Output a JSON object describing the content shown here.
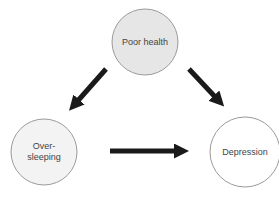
{
  "diagram": {
    "type": "causal-triangle",
    "nodes": [
      {
        "id": "poor_health",
        "label": "Poor health",
        "cx": 145,
        "cy": 42,
        "r": 33,
        "fill": "#e6e6e6"
      },
      {
        "id": "oversleeping",
        "label_lines": [
          "Over-",
          "sleeping"
        ],
        "cx": 44,
        "cy": 152,
        "r": 33,
        "fill": "#f3f3f3"
      },
      {
        "id": "depression",
        "label": "Depression",
        "cx": 245,
        "cy": 152,
        "r": 35,
        "fill": "#ffffff"
      }
    ],
    "edges": [
      {
        "from": "poor_health",
        "to": "oversleeping"
      },
      {
        "from": "poor_health",
        "to": "depression"
      },
      {
        "from": "oversleeping",
        "to": "depression"
      }
    ],
    "colors": {
      "stroke": "#999999",
      "arrow": "#1a1a1a",
      "text": "#444444"
    }
  }
}
